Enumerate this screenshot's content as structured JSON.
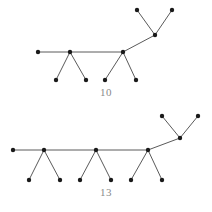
{
  "figure": {
    "background_color": "#ffffff",
    "node_color": "#1a1a1a",
    "edge_color": "#5a5a5a",
    "caption_color": "#8a8a8a",
    "node_radius": 2.2,
    "edge_width": 1
  },
  "graphs": [
    {
      "id": "graph-top",
      "caption": "10",
      "node_count": 10,
      "edge_count": 9,
      "nodes": [
        {
          "id": "t0",
          "role": "spine-end-leaf",
          "x": 38,
          "y": 52
        },
        {
          "id": "t1",
          "role": "spine-junction",
          "x": 70,
          "y": 52
        },
        {
          "id": "t2",
          "role": "leaf",
          "x": 56,
          "y": 80
        },
        {
          "id": "t3",
          "role": "leaf",
          "x": 86,
          "y": 80
        },
        {
          "id": "t4",
          "role": "spine-junction",
          "x": 123,
          "y": 52
        },
        {
          "id": "t5",
          "role": "leaf",
          "x": 105,
          "y": 80
        },
        {
          "id": "t6",
          "role": "leaf",
          "x": 136,
          "y": 80
        },
        {
          "id": "t7",
          "role": "upper-junction",
          "x": 155,
          "y": 35
        },
        {
          "id": "t8",
          "role": "leaf",
          "x": 137,
          "y": 10
        },
        {
          "id": "t9",
          "role": "leaf",
          "x": 172,
          "y": 10
        }
      ],
      "edges": [
        {
          "from": "t0",
          "to": "t1"
        },
        {
          "from": "t1",
          "to": "t2"
        },
        {
          "from": "t1",
          "to": "t3"
        },
        {
          "from": "t1",
          "to": "t4"
        },
        {
          "from": "t4",
          "to": "t5"
        },
        {
          "from": "t4",
          "to": "t6"
        },
        {
          "from": "t4",
          "to": "t7"
        },
        {
          "from": "t7",
          "to": "t8"
        },
        {
          "from": "t7",
          "to": "t9"
        }
      ]
    },
    {
      "id": "graph-bottom",
      "caption": "13",
      "node_count": 13,
      "edge_count": 12,
      "nodes": [
        {
          "id": "b0",
          "role": "spine-end-leaf",
          "x": 13,
          "y": 150
        },
        {
          "id": "b1",
          "role": "spine-junction",
          "x": 44,
          "y": 150
        },
        {
          "id": "b2",
          "role": "leaf",
          "x": 29,
          "y": 180
        },
        {
          "id": "b3",
          "role": "leaf",
          "x": 60,
          "y": 180
        },
        {
          "id": "b4",
          "role": "spine-junction",
          "x": 96,
          "y": 150
        },
        {
          "id": "b5",
          "role": "leaf",
          "x": 80,
          "y": 180
        },
        {
          "id": "b6",
          "role": "leaf",
          "x": 111,
          "y": 180
        },
        {
          "id": "b7",
          "role": "spine-junction",
          "x": 148,
          "y": 150
        },
        {
          "id": "b8",
          "role": "leaf",
          "x": 131,
          "y": 180
        },
        {
          "id": "b9",
          "role": "leaf",
          "x": 162,
          "y": 180
        },
        {
          "id": "b10",
          "role": "upper-junction",
          "x": 180,
          "y": 138
        },
        {
          "id": "b11",
          "role": "leaf",
          "x": 162,
          "y": 116
        },
        {
          "id": "b12",
          "role": "leaf",
          "x": 198,
          "y": 116
        }
      ],
      "edges": [
        {
          "from": "b0",
          "to": "b1"
        },
        {
          "from": "b1",
          "to": "b2"
        },
        {
          "from": "b1",
          "to": "b3"
        },
        {
          "from": "b1",
          "to": "b4"
        },
        {
          "from": "b4",
          "to": "b5"
        },
        {
          "from": "b4",
          "to": "b6"
        },
        {
          "from": "b4",
          "to": "b7"
        },
        {
          "from": "b7",
          "to": "b8"
        },
        {
          "from": "b7",
          "to": "b9"
        },
        {
          "from": "b7",
          "to": "b10"
        },
        {
          "from": "b10",
          "to": "b11"
        },
        {
          "from": "b10",
          "to": "b12"
        }
      ]
    }
  ]
}
